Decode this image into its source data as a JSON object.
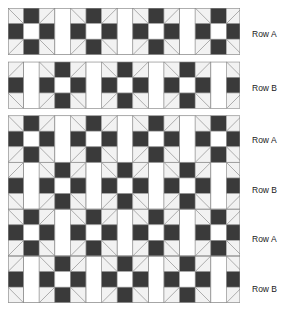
{
  "diagram": {
    "type": "quilt-piecing-diagram",
    "canvas": {
      "width": 289,
      "height": 310
    },
    "colors": {
      "dark_fabric": "#3a3a3a",
      "light_fabric": "#ffffff",
      "background_fabric": "#f2f2f2",
      "seam_line": "#9a9a9a",
      "outline": "#808080",
      "label_text": "#1a1a1a"
    },
    "geometry": {
      "cell_size": 15.6,
      "block_cells": 3,
      "block_size": 46.8,
      "sashing_width": 15.6,
      "unit_pitch": 62.4,
      "origin_x": 8,
      "origin_y": 8,
      "strip_gap": 7
    },
    "block": {
      "name": "shoofly-block",
      "grid": [
        [
          "corner-triangle",
          "dark",
          "corner-triangle"
        ],
        [
          "dark",
          "light",
          "dark"
        ],
        [
          "corner-triangle",
          "dark",
          "corner-triangle"
        ]
      ],
      "corner_diagonals": [
        "tl-to-br",
        "tr-to-bl",
        "tr-to-bl",
        "tl-to-br"
      ]
    },
    "row_types": {
      "A": {
        "label": "Row A",
        "offset_units": 0,
        "description": "Blocks aligned starting flush at the left edge, separated by vertical sashing strips.",
        "blocks_full": 4,
        "blocks_partial": 0
      },
      "B": {
        "label": "Row B",
        "offset_units": 0.5,
        "description": "Blocks shifted one half unit so the row begins and ends with a partial block.",
        "blocks_full": 3,
        "blocks_partial": 2
      }
    },
    "sections": [
      {
        "name": "legend-strip-row-a",
        "separated": true,
        "rows": [
          {
            "type": "A",
            "label": "Row A"
          }
        ]
      },
      {
        "name": "legend-strip-row-b",
        "separated": true,
        "rows": [
          {
            "type": "B",
            "label": "Row B"
          }
        ]
      },
      {
        "name": "assembled-quilt-top",
        "separated": false,
        "rows": [
          {
            "type": "A",
            "label": "Row A"
          },
          {
            "type": "B",
            "label": "Row B"
          },
          {
            "type": "A",
            "label": "Row A"
          },
          {
            "type": "B",
            "label": "Row B"
          }
        ]
      }
    ],
    "labels": [
      {
        "text": "Row A",
        "x": 252,
        "y": 37
      },
      {
        "text": "Row B",
        "x": 252,
        "y": 91
      },
      {
        "text": "Row A",
        "x": 252,
        "y": 143
      },
      {
        "text": "Row B",
        "x": 252,
        "y": 193
      },
      {
        "text": "Row A",
        "x": 252,
        "y": 242
      },
      {
        "text": "Row B",
        "x": 252,
        "y": 292
      }
    ]
  }
}
